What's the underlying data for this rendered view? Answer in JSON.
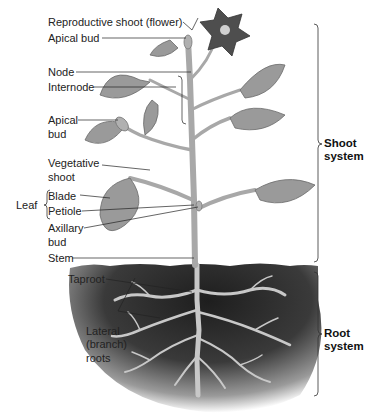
{
  "diagram": {
    "type": "plant-anatomy",
    "colors": {
      "flower": "#5a5a5a",
      "leaf": "#9a9a9a",
      "stem": "#b8b8b8",
      "soil_dark": "#2c2c2c",
      "root": "#c8c8c8",
      "leader_line": "#222222"
    },
    "labels": {
      "reproductive_shoot": "Reproductive shoot (flower)",
      "apical_bud_top": "Apical bud",
      "node": "Node",
      "internode": "Internode",
      "apical_bud_side_1": "Apical",
      "apical_bud_side_2": "bud",
      "vegetative_shoot_1": "Vegetative",
      "vegetative_shoot_2": "shoot",
      "leaf": "Leaf",
      "blade": "Blade",
      "petiole": "Petiole",
      "axillary_bud_1": "Axillary",
      "axillary_bud_2": "bud",
      "stem": "Stem",
      "taproot": "Taproot",
      "lateral_roots_1": "Lateral",
      "lateral_roots_2": "(branch)",
      "lateral_roots_3": "roots"
    },
    "systems": {
      "shoot_1": "Shoot",
      "shoot_2": "system",
      "root_1": "Root",
      "root_2": "system"
    }
  }
}
